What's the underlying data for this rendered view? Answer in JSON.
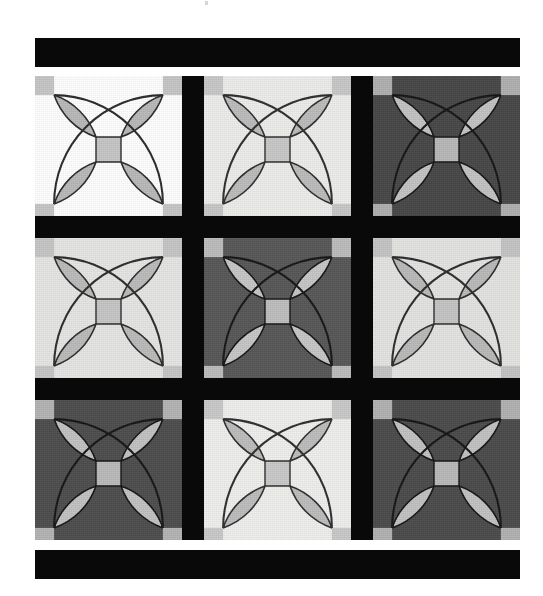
{
  "document": {
    "kind": "quilt-pattern-illustration",
    "page_background": "#ffffff",
    "caption": "",
    "title": "",
    "artifact_mark": ""
  },
  "palette": {
    "sashing_black": "#090909",
    "binding_black": "#090909",
    "white": "#ffffff",
    "off_white": "#ededec",
    "light_gray": "#dedede",
    "pale_gray": "#e8e8e6",
    "motif_gray": "#b9b9b9",
    "motif_gray_on_dark": "#c3c3c3",
    "dark_gray": "#4a4a4a",
    "outline": "#2a2a2a",
    "outline_on_dark": "#1a1a1a"
  },
  "binding": {
    "top_label": "top binding strip",
    "bottom_label": "bottom binding strip",
    "height_px": "29",
    "width_px": "485"
  },
  "layout": {
    "grid_rows": "3",
    "grid_cols": "3",
    "sashing_width_px": "22",
    "quilt_width_px": "485",
    "quilt_height_px": "464",
    "stage_width_px": "543",
    "stage_height_px": "596"
  },
  "blocks": [
    {
      "id": "block-r1c1",
      "row": "1",
      "col": "1",
      "name": "top-left-block",
      "background": "#ffffff",
      "motif_fill": "#b9b9b9",
      "outline": "#2a2a2a",
      "corner_fill": "#c6c6c6",
      "center_fill": "#c6c6c6",
      "value_label": "light",
      "tone": "white"
    },
    {
      "id": "block-r1c2",
      "row": "1",
      "col": "2",
      "name": "top-center-block",
      "background": "#ededec",
      "motif_fill": "#bcbcbc",
      "outline": "#2e2e2e",
      "corner_fill": "#c8c8c8",
      "center_fill": "#c8c8c8",
      "value_label": "light",
      "tone": "off-white"
    },
    {
      "id": "block-r1c3",
      "row": "1",
      "col": "3",
      "name": "top-right-block",
      "background": "#474747",
      "motif_fill": "#c3c3c3",
      "outline": "#151515",
      "corner_fill": "#b0b0b0",
      "center_fill": "#b8b8b8",
      "value_label": "dark",
      "tone": "dark-gray"
    },
    {
      "id": "block-r2c1",
      "row": "2",
      "col": "1",
      "name": "middle-left-block",
      "background": "#e6e6e4",
      "motif_fill": "#bbbbbb",
      "outline": "#2c2c2c",
      "corner_fill": "#c6c6c6",
      "center_fill": "#c6c6c6",
      "value_label": "light",
      "tone": "light-gray"
    },
    {
      "id": "block-r2c2",
      "row": "2",
      "col": "2",
      "name": "center-block",
      "background": "#575757",
      "motif_fill": "#c6c6c6",
      "outline": "#161616",
      "corner_fill": "#bcbcbc",
      "center_fill": "#bebebe",
      "value_label": "dark",
      "tone": "medium-dark-gray"
    },
    {
      "id": "block-r2c3",
      "row": "2",
      "col": "3",
      "name": "middle-right-block",
      "background": "#e4e4e2",
      "motif_fill": "#bababa",
      "outline": "#2c2c2c",
      "corner_fill": "#c5c5c5",
      "center_fill": "#c5c5c5",
      "value_label": "light",
      "tone": "light-gray"
    },
    {
      "id": "block-r3c1",
      "row": "3",
      "col": "1",
      "name": "bottom-left-block",
      "background": "#4d4d4d",
      "motif_fill": "#c2c2c2",
      "outline": "#151515",
      "corner_fill": "#b4b4b4",
      "center_fill": "#bababa",
      "value_label": "dark",
      "tone": "dark-gray"
    },
    {
      "id": "block-r3c2",
      "row": "3",
      "col": "2",
      "name": "bottom-center-block",
      "background": "#efefee",
      "motif_fill": "#bdbdbd",
      "outline": "#2e2e2e",
      "corner_fill": "#c9c9c9",
      "center_fill": "#c9c9c9",
      "value_label": "light",
      "tone": "off-white"
    },
    {
      "id": "block-r3c3",
      "row": "3",
      "col": "3",
      "name": "bottom-right-block",
      "background": "#4b4b4b",
      "motif_fill": "#c2c2c2",
      "outline": "#151515",
      "corner_fill": "#b2b2b2",
      "center_fill": "#b9b9b9",
      "value_label": "dark",
      "tone": "dark-gray"
    }
  ],
  "motif": {
    "name": "orange-peel-four-petal",
    "petal_count": "4",
    "corner_square_count": "4",
    "center_square_count": "1",
    "description": "four lens-shaped petals radiating from a central square"
  },
  "sashes": [
    {
      "name": "vertical-sash-left",
      "orientation": "vertical"
    },
    {
      "name": "vertical-sash-right",
      "orientation": "vertical"
    },
    {
      "name": "horizontal-sash-top",
      "orientation": "horizontal"
    },
    {
      "name": "horizontal-sash-bottom",
      "orientation": "horizontal"
    }
  ]
}
